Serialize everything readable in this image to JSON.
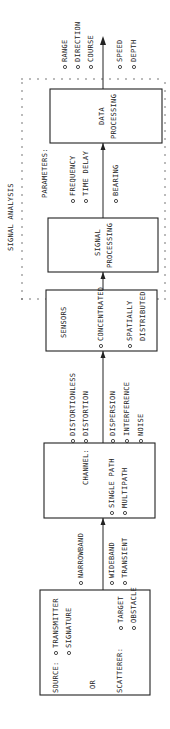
{
  "diagram": {
    "title": "SIGNAL ANALYSIS",
    "source_box": {
      "source_label": "SOURCE:",
      "source_items": [
        "TRANSMITTER",
        "SIGNATURE"
      ],
      "or_label": "OR",
      "scatterer_label": "SCATTERER:",
      "scatterer_items": [
        "TARGET",
        "OBSTACLE"
      ]
    },
    "source_to_channel": {
      "top_items": [
        "NARROWBAND"
      ],
      "bottom_items": [
        "WIDEBAND",
        "TRANSIENT"
      ]
    },
    "channel_box": {
      "label": "CHANNEL:",
      "items": [
        "SINGLE PATH",
        "MULTIPATH"
      ]
    },
    "channel_to_sensors": {
      "top_items": [
        "DISTORTIONLESS",
        "DISTORTION"
      ],
      "bottom_items": [
        "DISPERSION",
        "INTERFERENCE",
        "NOISE"
      ]
    },
    "sensors_box": {
      "label": "SENSORS",
      "items": [
        "CONCENTRATED",
        "SPATIALLY DISTRIBUTED"
      ],
      "spatially_line1": "SPATIALLY",
      "spatially_line2": "DISTRIBUTED"
    },
    "signal_processing_box": {
      "line1": "SIGNAL",
      "line2": "PROCESSING"
    },
    "parameters": {
      "label": "PARAMETERS:",
      "top_items": [
        "FREQUENCY",
        "TIME DELAY"
      ],
      "bottom_items": [
        "BEARING"
      ]
    },
    "data_processing_box": {
      "line1": "DATA",
      "line2": "PROCESSING"
    },
    "outputs": {
      "top_items": [
        "RANGE",
        "DIRECTION",
        "COURSE"
      ],
      "bottom_items": [
        "SPEED",
        "DEPTH"
      ]
    }
  }
}
